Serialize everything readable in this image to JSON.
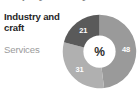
{
  "figure": {
    "width": 139,
    "height": 96,
    "background": "#ffffff",
    "cropped_heading": "Employment by sector"
  },
  "legend": {
    "items": [
      {
        "label": "Industry and craft",
        "color": "#262626",
        "emphasis": "bold"
      },
      {
        "label": "Services",
        "color": "#9b9b9b",
        "emphasis": "normal"
      }
    ]
  },
  "donut": {
    "center_symbol": "%",
    "hole_fill": "#ffffff"
  },
  "chart_data": {
    "type": "pie",
    "variant": "donut",
    "title": "Employment by sector",
    "unit": "%",
    "center_label": "%",
    "categories": [
      "Services",
      "Industry and craft",
      "Agriculture"
    ],
    "values": [
      48,
      21,
      31
    ],
    "labels": [
      "48",
      "21",
      "31"
    ],
    "colors": [
      "#9a9a9a",
      "#5a5a5a",
      "#b0b0b0"
    ],
    "label_color": "#ffffff",
    "slices": [
      {
        "label": "48",
        "value": 48,
        "color": "#9a9a9a",
        "start_deg": 0,
        "end_deg": 172.8,
        "legend": "Services"
      },
      {
        "label": "31",
        "value": 31,
        "color": "#b0b0b0",
        "start_deg": 172.8,
        "end_deg": 284.4,
        "legend": ""
      },
      {
        "label": "21",
        "value": 21,
        "color": "#5a5a5a",
        "start_deg": 284.4,
        "end_deg": 360,
        "legend": "Industry and craft"
      }
    ],
    "total": 100,
    "legend_position": "left",
    "grid": false,
    "xlabel": "",
    "ylabel": ""
  }
}
